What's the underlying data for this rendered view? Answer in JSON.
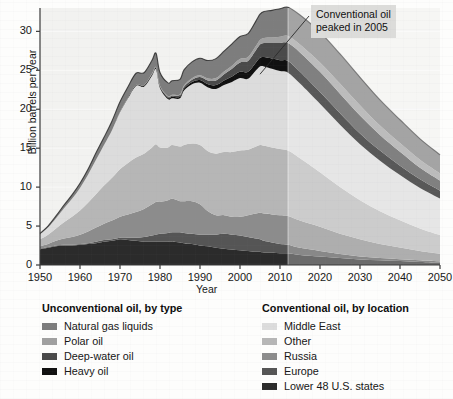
{
  "chart_data": {
    "type": "area",
    "stacked": true,
    "title": "",
    "xlabel": "Year",
    "ylabel": "Billion barrels per year",
    "xlim": [
      1950,
      2050
    ],
    "ylim": [
      0,
      33
    ],
    "xticks": [
      1950,
      1960,
      1970,
      1980,
      1990,
      2000,
      2010,
      2020,
      2030,
      2040,
      2050
    ],
    "yticks": [
      0,
      5,
      10,
      15,
      20,
      25,
      30
    ],
    "grid": "horizontal-faint",
    "legend_position": "below",
    "forecast_start": 2012,
    "annotations": [
      {
        "text_line1": "Conventional oil",
        "text_line2": "peaked in 2005",
        "points_to_year": 2005,
        "points_to_value": 24.5
      }
    ],
    "x": [
      1950,
      1952,
      1954,
      1956,
      1958,
      1960,
      1962,
      1964,
      1966,
      1968,
      1970,
      1972,
      1974,
      1976,
      1978,
      1979,
      1980,
      1982,
      1983,
      1985,
      1986,
      1988,
      1990,
      1992,
      1994,
      1996,
      1998,
      2000,
      2002,
      2004,
      2005,
      2006,
      2008,
      2010,
      2012,
      2015,
      2020,
      2025,
      2030,
      2035,
      2040,
      2045,
      2050
    ],
    "series": [
      {
        "name": "Lower 48 U.S. states",
        "group": "conventional",
        "color": "#2b2b2b",
        "values": [
          2.0,
          2.2,
          2.4,
          2.5,
          2.5,
          2.6,
          2.7,
          2.8,
          3.0,
          3.1,
          3.3,
          3.2,
          3.1,
          3.0,
          3.0,
          3.0,
          3.0,
          3.0,
          3.0,
          2.9,
          2.8,
          2.7,
          2.5,
          2.4,
          2.2,
          2.1,
          2.0,
          1.9,
          1.8,
          1.7,
          1.7,
          1.6,
          1.6,
          1.5,
          1.5,
          1.3,
          1.1,
          0.9,
          0.7,
          0.6,
          0.5,
          0.4,
          0.3
        ]
      },
      {
        "name": "Europe",
        "group": "conventional",
        "color": "#555555",
        "values": [
          0.1,
          0.1,
          0.1,
          0.1,
          0.1,
          0.1,
          0.1,
          0.2,
          0.2,
          0.2,
          0.2,
          0.3,
          0.4,
          0.6,
          0.8,
          0.9,
          1.0,
          1.1,
          1.2,
          1.3,
          1.3,
          1.3,
          1.4,
          1.5,
          1.7,
          1.9,
          1.9,
          1.9,
          1.8,
          1.7,
          1.6,
          1.5,
          1.3,
          1.2,
          1.1,
          0.9,
          0.7,
          0.5,
          0.4,
          0.3,
          0.25,
          0.2,
          0.15
        ]
      },
      {
        "name": "Russia",
        "group": "conventional",
        "color": "#8c8c8c",
        "values": [
          0.3,
          0.4,
          0.6,
          0.8,
          1.0,
          1.2,
          1.5,
          1.8,
          2.1,
          2.4,
          2.7,
          3.0,
          3.3,
          3.6,
          4.0,
          4.2,
          4.1,
          4.2,
          4.3,
          4.0,
          4.1,
          4.2,
          3.9,
          3.0,
          2.5,
          2.4,
          2.3,
          2.4,
          2.8,
          3.2,
          3.4,
          3.5,
          3.6,
          3.7,
          3.7,
          3.5,
          3.1,
          2.6,
          2.2,
          1.8,
          1.5,
          1.2,
          1.0
        ]
      },
      {
        "name": "Other",
        "group": "conventional",
        "color": "#b6b6b6",
        "values": [
          0.9,
          1.2,
          1.6,
          2.1,
          2.6,
          3.1,
          3.7,
          4.3,
          4.9,
          5.5,
          6.1,
          6.6,
          7.0,
          7.1,
          7.3,
          7.4,
          7.0,
          6.8,
          6.9,
          7.0,
          7.2,
          7.4,
          7.6,
          7.7,
          7.9,
          8.1,
          8.3,
          8.5,
          8.4,
          8.6,
          8.7,
          8.7,
          8.6,
          8.5,
          8.4,
          8.0,
          7.0,
          6.0,
          5.0,
          4.2,
          3.5,
          2.9,
          2.4
        ]
      },
      {
        "name": "Middle East",
        "group": "conventional",
        "color": "#dcdcdc",
        "values": [
          0.6,
          0.9,
          1.3,
          1.8,
          2.3,
          2.9,
          3.6,
          4.4,
          5.2,
          6.1,
          7.3,
          8.3,
          9.2,
          8.6,
          9.2,
          9.6,
          7.6,
          6.2,
          6.0,
          6.2,
          7.0,
          7.6,
          8.0,
          8.2,
          8.3,
          8.6,
          9.0,
          9.3,
          9.1,
          9.8,
          10.1,
          10.2,
          10.1,
          10.0,
          10.0,
          9.6,
          8.8,
          8.0,
          7.2,
          6.5,
          5.8,
          5.2,
          4.7
        ]
      },
      {
        "name": "Heavy oil",
        "group": "unconventional",
        "color": "#111111",
        "values": [
          0.0,
          0.0,
          0.0,
          0.0,
          0.0,
          0.0,
          0.0,
          0.0,
          0.0,
          0.0,
          0.05,
          0.08,
          0.1,
          0.12,
          0.15,
          0.15,
          0.15,
          0.18,
          0.2,
          0.22,
          0.25,
          0.3,
          0.35,
          0.4,
          0.5,
          0.6,
          0.7,
          0.8,
          0.9,
          1.0,
          1.1,
          1.2,
          1.3,
          1.4,
          1.5,
          1.5,
          1.5,
          1.5,
          1.4,
          1.3,
          1.2,
          1.1,
          1.0
        ]
      },
      {
        "name": "Deep-water oil",
        "group": "unconventional",
        "color": "#4a4a4a",
        "values": [
          0.0,
          0.0,
          0.0,
          0.0,
          0.0,
          0.0,
          0.0,
          0.0,
          0.0,
          0.0,
          0.0,
          0.0,
          0.02,
          0.05,
          0.08,
          0.1,
          0.1,
          0.12,
          0.15,
          0.2,
          0.25,
          0.3,
          0.4,
          0.5,
          0.6,
          0.8,
          1.0,
          1.2,
          1.4,
          1.6,
          1.7,
          1.8,
          2.0,
          2.2,
          2.3,
          2.5,
          2.6,
          2.5,
          2.3,
          2.0,
          1.8,
          1.5,
          1.3
        ]
      },
      {
        "name": "Polar oil",
        "group": "unconventional",
        "color": "#a0a0a0",
        "values": [
          0.0,
          0.0,
          0.0,
          0.0,
          0.0,
          0.0,
          0.0,
          0.0,
          0.0,
          0.0,
          0.0,
          0.0,
          0.0,
          0.02,
          0.05,
          0.06,
          0.06,
          0.08,
          0.1,
          0.12,
          0.15,
          0.18,
          0.2,
          0.25,
          0.3,
          0.35,
          0.4,
          0.45,
          0.5,
          0.55,
          0.6,
          0.65,
          0.7,
          0.8,
          0.9,
          1.0,
          1.2,
          1.3,
          1.3,
          1.2,
          1.1,
          1.0,
          0.9
        ]
      },
      {
        "name": "Natural gas liquids",
        "group": "unconventional",
        "color": "#7d7d7d",
        "values": [
          0.15,
          0.2,
          0.3,
          0.4,
          0.5,
          0.6,
          0.7,
          0.9,
          1.0,
          1.2,
          1.3,
          1.4,
          1.5,
          1.6,
          1.7,
          1.8,
          1.7,
          1.7,
          1.8,
          1.9,
          2.0,
          2.1,
          2.2,
          2.3,
          2.5,
          2.6,
          2.8,
          2.9,
          3.0,
          3.2,
          3.3,
          3.4,
          3.5,
          3.6,
          3.7,
          3.8,
          3.9,
          3.8,
          3.6,
          3.3,
          3.0,
          2.7,
          2.4
        ]
      }
    ]
  },
  "axes": {
    "ylabel": "Billion barrels per year",
    "xlabel": "Year",
    "yticks": [
      "0",
      "5",
      "10",
      "15",
      "20",
      "25",
      "30"
    ],
    "xticks": [
      "1950",
      "1960",
      "1970",
      "1980",
      "1990",
      "2000",
      "2010",
      "2020",
      "2030",
      "2040",
      "2050"
    ]
  },
  "annotation": {
    "line1": "Conventional oil",
    "line2": "peaked in 2005"
  },
  "legend": {
    "left": {
      "title": "Unconventional oil, by type",
      "items": [
        {
          "label": "Natural gas liquids",
          "color": "#7d7d7d"
        },
        {
          "label": "Polar oil",
          "color": "#a0a0a0"
        },
        {
          "label": "Deep-water oil",
          "color": "#4a4a4a"
        },
        {
          "label": "Heavy oil",
          "color": "#111111"
        }
      ]
    },
    "right": {
      "title": "Conventional oil, by location",
      "items": [
        {
          "label": "Middle East",
          "color": "#dcdcdc"
        },
        {
          "label": "Other",
          "color": "#b6b6b6"
        },
        {
          "label": "Russia",
          "color": "#8c8c8c"
        },
        {
          "label": "Europe",
          "color": "#555555"
        },
        {
          "label": "Lower 48 U.S. states",
          "color": "#2b2b2b"
        }
      ]
    }
  }
}
